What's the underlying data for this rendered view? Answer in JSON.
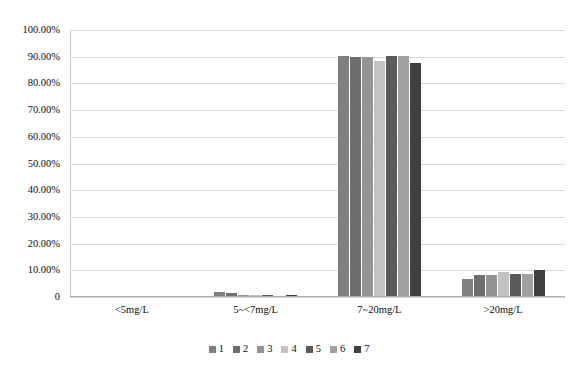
{
  "chart_data": {
    "type": "bar",
    "title": "",
    "xlabel": "",
    "ylabel": "",
    "categories": [
      "<5mg/L",
      "5~<7mg/L",
      "7~20mg/L",
      ">20mg/L"
    ],
    "ylim": [
      0,
      100
    ],
    "ytick_labels": [
      "100.00%",
      "90.00%",
      "80.00%",
      "70.00%",
      "60.00%",
      "50.00%",
      "40.00%",
      "30.00%",
      "20.00%",
      "10.00%",
      "0"
    ],
    "ytick_values": [
      100,
      90,
      80,
      70,
      60,
      50,
      40,
      30,
      20,
      10,
      0
    ],
    "grid": true,
    "legend_position": "bottom",
    "series": [
      {
        "name": "1",
        "color": "#808080",
        "values": [
          0.2,
          1.8,
          90.2,
          6.6
        ]
      },
      {
        "name": "2",
        "color": "#6e6e6e",
        "values": [
          0.2,
          1.6,
          90.0,
          8.2
        ]
      },
      {
        "name": "3",
        "color": "#949494",
        "values": [
          0.1,
          0.7,
          90.0,
          8.2
        ]
      },
      {
        "name": "4",
        "color": "#c2c2c2",
        "values": [
          0.1,
          0.6,
          88.4,
          9.2
        ]
      },
      {
        "name": "5",
        "color": "#5a5a5a",
        "values": [
          0.1,
          0.8,
          90.1,
          8.5
        ]
      },
      {
        "name": "6",
        "color": "#a0a0a0",
        "values": [
          0.1,
          0.4,
          90.1,
          8.6
        ]
      },
      {
        "name": "7",
        "color": "#3f3f3f",
        "values": [
          0.1,
          0.7,
          87.6,
          10.0
        ]
      }
    ]
  },
  "legend": {
    "items": [
      {
        "label": "1",
        "color": "#808080"
      },
      {
        "label": "2",
        "color": "#6e6e6e"
      },
      {
        "label": "3",
        "color": "#949494"
      },
      {
        "label": "4",
        "color": "#c2c2c2"
      },
      {
        "label": "5",
        "color": "#5a5a5a"
      },
      {
        "label": "6",
        "color": "#a0a0a0"
      },
      {
        "label": "7",
        "color": "#3f3f3f"
      }
    ]
  },
  "colors": {
    "gridline": "#d9d9d9",
    "axis": "#c9c9c9",
    "text": "#0d0d0d",
    "background": "#ffffff"
  }
}
